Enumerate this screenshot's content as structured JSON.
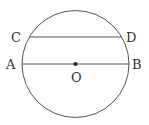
{
  "diagram": {
    "type": "geometry",
    "stroke_color": "#555555",
    "circle": {
      "cx": 75.5,
      "cy": 64,
      "r": 53.5,
      "center_label": "O"
    },
    "chords": [
      {
        "name": "CD",
        "from": "C",
        "to": "D",
        "x1": 29.5,
        "y1": 37,
        "x2": 121.5,
        "y2": 37
      },
      {
        "name": "AB",
        "from": "A",
        "to": "B",
        "x1": 22,
        "y1": 64,
        "x2": 129,
        "y2": 64,
        "is_diameter": true
      }
    ],
    "points": [
      {
        "label": "C",
        "x": 18,
        "y": 42
      },
      {
        "label": "D",
        "x": 126,
        "y": 42
      },
      {
        "label": "A",
        "x": 6,
        "y": 69
      },
      {
        "label": "B",
        "x": 132,
        "y": 69
      },
      {
        "label": "O",
        "x": 71,
        "y": 82
      }
    ]
  }
}
